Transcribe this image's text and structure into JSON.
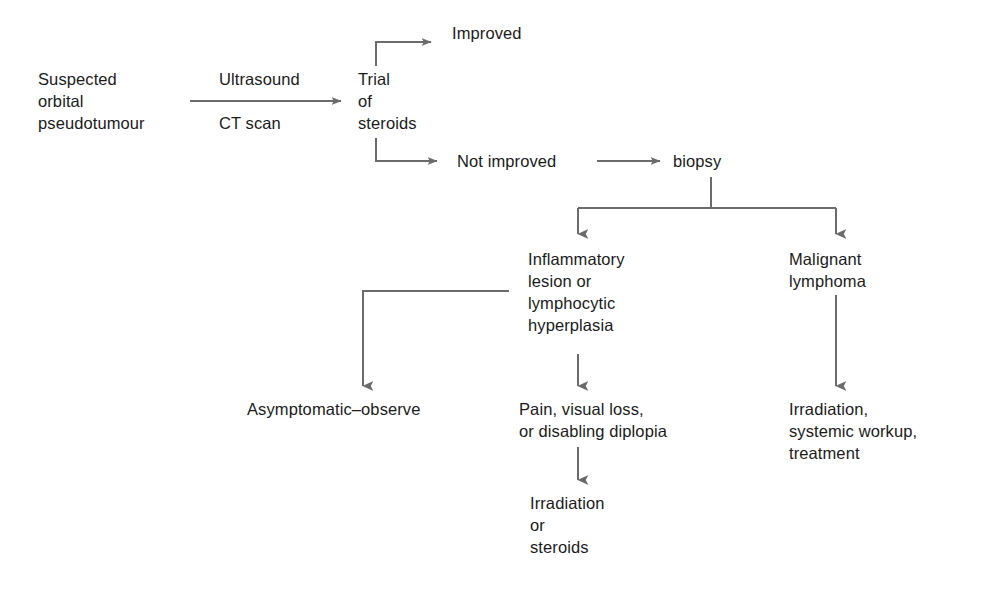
{
  "diagram": {
    "background_color": "#ffffff",
    "line_color": "#6b6b6b",
    "text_color": "#1b1b1b",
    "nodes": {
      "start": "Suspected\norbital\npseudotumour",
      "imaging_label": "Ultrasound",
      "imaging_label2": "CT scan",
      "trial": "Trial\nof\nsteroids",
      "improved": "Improved",
      "not_improved": "Not improved",
      "biopsy": "biopsy",
      "inflammatory": "Inflammatory\nlesion or\nlymphocytic\nhyperplasia",
      "malignant": "Malignant\nlymphoma",
      "asymptomatic": "Asymptomatic–observe",
      "pain": "Pain, visual loss,\nor disabling diplopia",
      "irradiation_or_steroids": "Irradiation\nor\nsteroids",
      "irradiation_systemic": "Irradiation,\nsystemic workup,\ntreatment"
    },
    "edges": [
      {
        "id": "start-to-trial",
        "from": "start",
        "to": "trial",
        "label": "Ultrasound / CT scan"
      },
      {
        "id": "trial-to-improved",
        "from": "trial",
        "to": "improved",
        "label": ""
      },
      {
        "id": "trial-to-not-improved",
        "from": "trial",
        "to": "not_improved",
        "label": ""
      },
      {
        "id": "not-improved-to-biopsy",
        "from": "not_improved",
        "to": "biopsy",
        "label": ""
      },
      {
        "id": "biopsy-to-inflammatory",
        "from": "biopsy",
        "to": "inflammatory",
        "label": ""
      },
      {
        "id": "biopsy-to-malignant",
        "from": "biopsy",
        "to": "malignant",
        "label": ""
      },
      {
        "id": "inflammatory-to-asymptomatic",
        "from": "inflammatory",
        "to": "asymptomatic",
        "label": ""
      },
      {
        "id": "inflammatory-to-pain",
        "from": "inflammatory",
        "to": "pain",
        "label": ""
      },
      {
        "id": "pain-to-irradiation-steroids",
        "from": "pain",
        "to": "irradiation_or_steroids",
        "label": ""
      },
      {
        "id": "malignant-to-irradiation-systemic",
        "from": "malignant",
        "to": "irradiation_systemic",
        "label": ""
      }
    ]
  }
}
